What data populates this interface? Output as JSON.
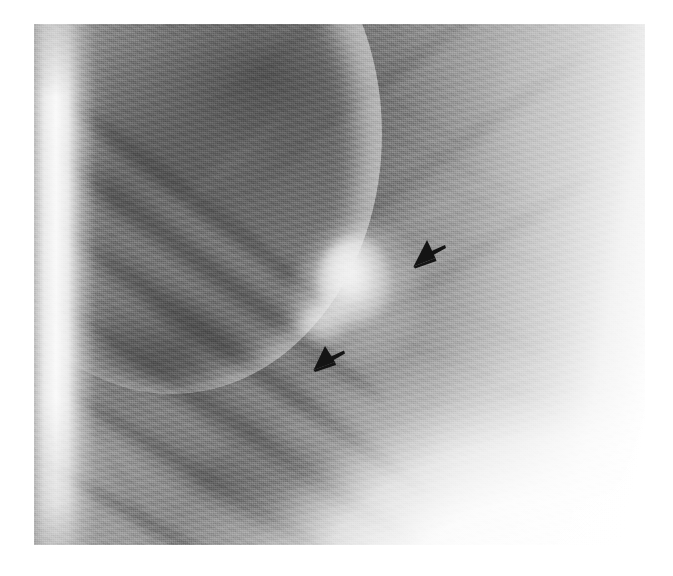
{
  "figure": {
    "kind": "radiograph-detail",
    "modality": "chest-radiograph",
    "caption": "",
    "background_color": "#ffffff"
  },
  "plate": {
    "name": "radiograph-plate",
    "left_px": 34,
    "top_px": 24,
    "width_px": 611,
    "height_px": 521,
    "grayscale_range": [
      "#3a3a3a",
      "#ffffff"
    ]
  },
  "anatomy": {
    "regions": [
      {
        "id": "lung-field",
        "label": "lung field",
        "tone": "#7b7b7b"
      },
      {
        "id": "chest-wall",
        "label": "lateral chest wall",
        "tone": "#f2f2f2"
      },
      {
        "id": "diaphragm",
        "label": "hemidiaphragm",
        "tone": "#ffffff"
      },
      {
        "id": "upper-zone",
        "label": "upper lung zone",
        "tone": "#646464"
      },
      {
        "id": "mediastinal-edge",
        "label": "mediastinal soft tissue",
        "tone": "#d9d9d9"
      }
    ],
    "ribs": {
      "posterior_label": "posterior rib",
      "anterior_label": "anterior rib",
      "posterior_count": 6,
      "anterior_count": 5
    }
  },
  "finding": {
    "id": "pulmonary-nodule",
    "label": "pulmonary nodule",
    "description": "ill-defined rounded opacity",
    "center_x_px": 320,
    "center_y_px": 258,
    "diameter_px": 74,
    "opacity_tone": "#f6f6f6"
  },
  "annotations": {
    "marker_color": "#141414",
    "arrows": [
      {
        "id": "arrow-upper",
        "name": "annotation-arrow-upper",
        "points_to": "pulmonary-nodule",
        "direction": "down-left",
        "x_px": 410,
        "y_px": 236,
        "size_px": 38
      },
      {
        "id": "arrow-lower",
        "name": "annotation-arrow-lower",
        "points_to": "pulmonary-nodule",
        "direction": "down-left",
        "x_px": 311,
        "y_px": 343,
        "size_px": 36
      }
    ]
  },
  "ribs_posterior": [
    {
      "left": -30,
      "top": 18,
      "width": 430,
      "rotate": 38
    },
    {
      "left": -24,
      "top": 86,
      "width": 470,
      "rotate": 37
    },
    {
      "left": -18,
      "top": 162,
      "width": 510,
      "rotate": 36
    },
    {
      "left": -12,
      "top": 246,
      "width": 540,
      "rotate": 34
    },
    {
      "left": -6,
      "top": 334,
      "width": 560,
      "rotate": 32
    },
    {
      "left": 0,
      "top": 424,
      "width": 560,
      "rotate": 30
    }
  ],
  "ribs_anterior": [
    {
      "left": 120,
      "top": 10,
      "width": 380,
      "rotate": -40
    },
    {
      "left": 170,
      "top": 84,
      "width": 400,
      "rotate": -39
    },
    {
      "left": 205,
      "top": 166,
      "width": 410,
      "rotate": -38
    },
    {
      "left": 230,
      "top": 256,
      "width": 400,
      "rotate": -36
    },
    {
      "left": 250,
      "top": 352,
      "width": 380,
      "rotate": -34
    }
  ],
  "interspaces": [
    {
      "left": -20,
      "top": 56,
      "width": 440,
      "rotate": 38
    },
    {
      "left": -14,
      "top": 128,
      "width": 480,
      "rotate": 37
    },
    {
      "left": -8,
      "top": 206,
      "width": 520,
      "rotate": 35
    },
    {
      "left": -4,
      "top": 292,
      "width": 540,
      "rotate": 33
    },
    {
      "left": 2,
      "top": 380,
      "width": 550,
      "rotate": 31
    }
  ],
  "vessels": [
    {
      "left": 300,
      "top": 40,
      "width": 150,
      "height": 11,
      "rotate": 30,
      "opacity": 0.26
    },
    {
      "left": 340,
      "top": 96,
      "width": 170,
      "height": 10,
      "rotate": 26,
      "opacity": 0.24
    },
    {
      "left": 386,
      "top": 150,
      "width": 140,
      "height": 9,
      "rotate": 22,
      "opacity": 0.22
    },
    {
      "left": 404,
      "top": 206,
      "width": 120,
      "height": 9,
      "rotate": 16,
      "opacity": 0.2
    },
    {
      "left": 150,
      "top": 120,
      "width": 130,
      "height": 10,
      "rotate": 52,
      "opacity": 0.22
    },
    {
      "left": 96,
      "top": 230,
      "width": 150,
      "height": 11,
      "rotate": 58,
      "opacity": 0.26
    },
    {
      "left": 120,
      "top": 330,
      "width": 170,
      "height": 12,
      "rotate": 48,
      "opacity": 0.28
    },
    {
      "left": 210,
      "top": 398,
      "width": 190,
      "height": 12,
      "rotate": 38,
      "opacity": 0.26
    },
    {
      "left": 330,
      "top": 300,
      "width": 140,
      "height": 9,
      "rotate": 20,
      "opacity": 0.18
    },
    {
      "left": 420,
      "top": 276,
      "width": 120,
      "height": 9,
      "rotate": 30,
      "opacity": 0.2
    },
    {
      "left": 440,
      "top": 344,
      "width": 110,
      "height": 9,
      "rotate": 26,
      "opacity": 0.18
    },
    {
      "left": 60,
      "top": 396,
      "width": 140,
      "height": 11,
      "rotate": 62,
      "opacity": 0.24
    }
  ],
  "vessels_bright": [
    {
      "left": 270,
      "top": 120,
      "width": 180,
      "height": 14,
      "rotate": -34,
      "opacity": 0.22
    },
    {
      "left": 330,
      "top": 220,
      "width": 170,
      "height": 14,
      "rotate": -30,
      "opacity": 0.24
    },
    {
      "left": 240,
      "top": 310,
      "width": 190,
      "height": 15,
      "rotate": -28,
      "opacity": 0.22
    },
    {
      "left": 380,
      "top": 392,
      "width": 170,
      "height": 14,
      "rotate": -26,
      "opacity": 0.2
    },
    {
      "left": 140,
      "top": 184,
      "width": 150,
      "height": 13,
      "rotate": -42,
      "opacity": 0.18
    }
  ]
}
